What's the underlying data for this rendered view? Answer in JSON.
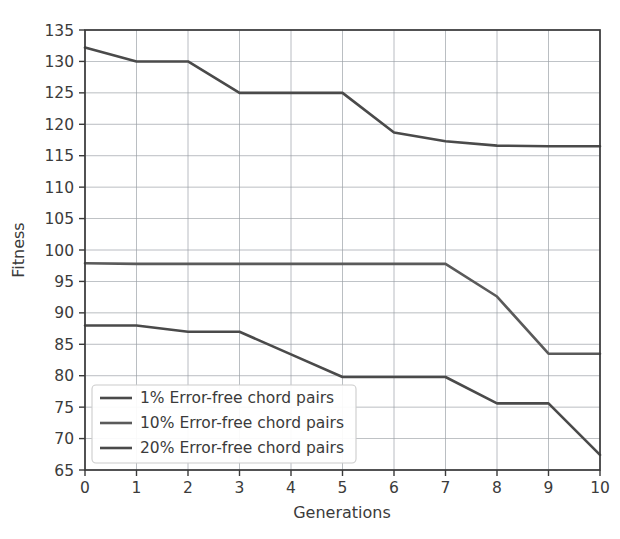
{
  "chart_data": {
    "type": "line",
    "title": "",
    "xlabel": "Generations",
    "ylabel": "Fitness",
    "x": [
      0,
      1,
      2,
      3,
      4,
      5,
      6,
      7,
      8,
      9,
      10
    ],
    "xlim": [
      0,
      10
    ],
    "ylim": [
      65,
      135
    ],
    "xticks": [
      "0",
      "1",
      "2",
      "3",
      "4",
      "5",
      "6",
      "7",
      "8",
      "9",
      "10"
    ],
    "yticks": [
      "65",
      "70",
      "75",
      "80",
      "85",
      "90",
      "95",
      "100",
      "105",
      "110",
      "115",
      "120",
      "125",
      "130",
      "135"
    ],
    "grid": true,
    "legend_position": "lower left",
    "series": [
      {
        "name": "1% Error-free chord pairs",
        "color": "#4a4a4a",
        "values": [
          132.2,
          130.0,
          130.0,
          125.0,
          125.0,
          125.0,
          118.7,
          117.3,
          116.6,
          116.5,
          116.5
        ]
      },
      {
        "name": "10% Error-free chord pairs",
        "color": "#5a5a5a",
        "values": [
          97.9,
          97.8,
          97.8,
          97.8,
          97.8,
          97.8,
          97.8,
          97.8,
          92.6,
          83.5,
          83.5
        ]
      },
      {
        "name": "20% Error-free chord pairs",
        "color": "#4a4a4a",
        "values": [
          88.0,
          88.0,
          87.0,
          87.0,
          83.4,
          79.8,
          79.8,
          79.8,
          75.6,
          75.6,
          67.4
        ]
      }
    ]
  },
  "axes": {
    "x_axis_title": "Generations",
    "y_axis_title": "Fitness"
  },
  "legend": {
    "entries": [
      {
        "label": "1% Error-free chord pairs"
      },
      {
        "label": "10% Error-free chord pairs"
      },
      {
        "label": "20% Error-free chord pairs"
      }
    ]
  }
}
